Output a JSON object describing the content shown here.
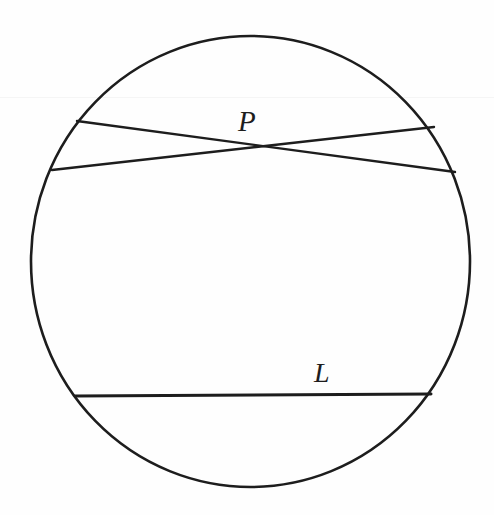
{
  "figure": {
    "kind": "geometry-diagram",
    "caption_labels": {
      "point_p": "P",
      "line_l": "L"
    },
    "background_color": "#fefefe",
    "stroke_color": "#1d1d1d"
  },
  "chart_data": {
    "type": "diagram",
    "title": "",
    "xlabel": "",
    "ylabel": "",
    "coordinate_space": {
      "width": 494,
      "height": 515,
      "origin": "top-left"
    },
    "shapes": [
      {
        "name": "circle",
        "type": "ellipse",
        "cx": 250.5,
        "cy": 261.5,
        "rx": 219.5,
        "ry": 225.5,
        "stroke_width": 2.6,
        "fill": "none"
      },
      {
        "name": "chord-upper-left-to-right",
        "type": "line",
        "x1": 77,
        "y1": 121,
        "x2": 455,
        "y2": 172,
        "stroke_width": 2.4
      },
      {
        "name": "chord-lower-left-to-right",
        "type": "line",
        "x1": 52,
        "y1": 170,
        "x2": 434,
        "y2": 127,
        "stroke_width": 2.4
      },
      {
        "name": "chord-l",
        "type": "line",
        "x1": 75,
        "y1": 396,
        "x2": 431,
        "y2": 394,
        "stroke_width": 3.0
      }
    ],
    "points": [
      {
        "name": "P",
        "label": "P",
        "x": 248,
        "y": 146,
        "description": "intersection of the two upper chords"
      }
    ],
    "annotations": [
      {
        "name": "label-P",
        "text": "P",
        "x": 248,
        "y": 122,
        "style": "italic-serif"
      },
      {
        "name": "label-L",
        "text": "L",
        "x": 324,
        "y": 373,
        "style": "italic-serif"
      }
    ],
    "legend": [],
    "grid": false
  }
}
